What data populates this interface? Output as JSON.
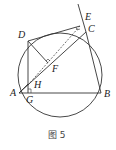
{
  "diagram": {
    "caption": "图 5",
    "points": {
      "A": {
        "label": "A",
        "x": 19,
        "y": 93
      },
      "B": {
        "label": "B",
        "x": 101,
        "y": 93
      },
      "C": {
        "label": "C",
        "x": 86,
        "y": 32
      },
      "D": {
        "label": "D",
        "x": 28,
        "y": 41
      },
      "E": {
        "label": "E",
        "x": 80,
        "y": 26
      },
      "F": {
        "label": "F",
        "x": 48,
        "y": 63
      },
      "G": {
        "label": "G",
        "x": 25,
        "y": 96
      },
      "H": {
        "label": "H",
        "x": 29,
        "y": 85
      }
    },
    "circle": {
      "cx": 60,
      "cy": 75,
      "r": 42
    },
    "colors": {
      "stroke": "#333333",
      "background": "#ffffff"
    }
  }
}
